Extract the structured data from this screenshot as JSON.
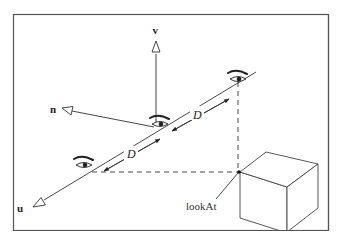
{
  "diagram": {
    "axes": {
      "v": "v",
      "n": "n",
      "u": "u"
    },
    "distance_labels": [
      "D",
      "D"
    ],
    "target_label": "lookAt",
    "eyes": [
      "eye-near-u",
      "eye-center",
      "eye-far"
    ],
    "object": "cube"
  }
}
